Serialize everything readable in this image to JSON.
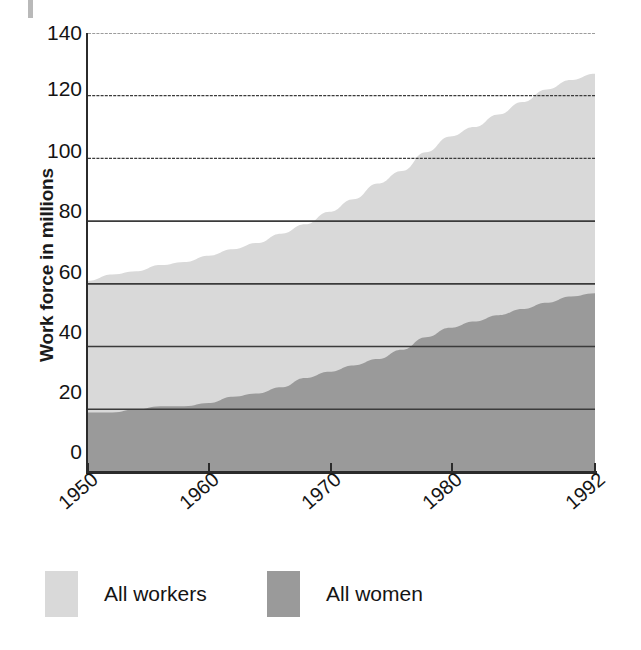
{
  "chart_data": {
    "type": "area",
    "title": "",
    "subtitle": "",
    "xlabel": "",
    "ylabel": "Work force in millions",
    "xlim": [
      1950,
      1992
    ],
    "ylim": [
      0,
      140
    ],
    "grid": true,
    "grid_axis": "y",
    "stacked": false,
    "legend_position": "bottom-left",
    "x_tick_labels": [
      "1950",
      "1960",
      "1970",
      "1980",
      "1992"
    ],
    "x_tick_values": [
      1950,
      1960,
      1970,
      1980,
      1992
    ],
    "y_tick_labels": [
      "0",
      "20",
      "40",
      "60",
      "80",
      "100",
      "120",
      "140"
    ],
    "y_tick_values": [
      0,
      20,
      40,
      60,
      80,
      100,
      120,
      140
    ],
    "x": [
      1950,
      1952,
      1954,
      1956,
      1958,
      1960,
      1962,
      1964,
      1966,
      1968,
      1970,
      1972,
      1974,
      1976,
      1978,
      1980,
      1982,
      1984,
      1986,
      1988,
      1990,
      1992
    ],
    "series": [
      {
        "name": "All workers",
        "color": "#d9d9d9",
        "values": [
          61,
          63,
          64,
          66,
          67,
          69,
          71,
          73,
          76,
          79,
          83,
          87,
          92,
          96,
          102,
          107,
          110,
          114,
          118,
          122,
          125,
          127
        ]
      },
      {
        "name": "All women",
        "color": "#9a9a9a",
        "values": [
          19,
          19,
          20,
          21,
          21,
          22,
          24,
          25,
          27,
          30,
          32,
          34,
          36,
          39,
          43,
          46,
          48,
          50,
          52,
          54,
          56,
          57
        ]
      }
    ],
    "annotations": []
  },
  "legend": {
    "entries": [
      {
        "label": "All workers",
        "color": "#d9d9d9"
      },
      {
        "label": "All women",
        "color": "#9a9a9a"
      }
    ]
  },
  "axes": {
    "y_title": "Work force in millions",
    "y_ticks": [
      "140",
      "120",
      "100",
      "80",
      "60",
      "40",
      "20",
      "0"
    ],
    "x_ticks": [
      "1950",
      "1960",
      "1970",
      "1980",
      "1992"
    ]
  },
  "colors": {
    "all_workers": "#d9d9d9",
    "all_women": "#9a9a9a",
    "gridline": "#3b3b3b",
    "axis": "#2b2b2b",
    "text": "#141414",
    "background": "#ffffff"
  }
}
